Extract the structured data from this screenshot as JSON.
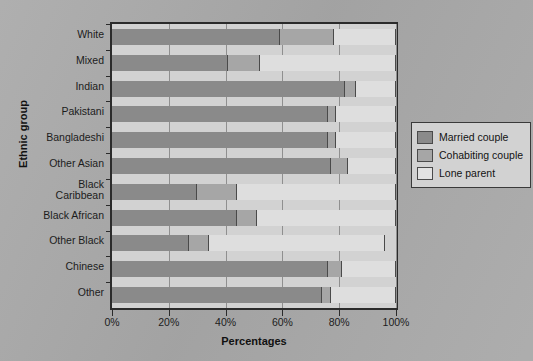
{
  "chart_data": {
    "type": "bar",
    "orientation": "horizontal",
    "stacked": true,
    "stack_mode": "percent",
    "title": "",
    "xlabel": "Percentages",
    "ylabel": "Ethnic group",
    "xlim": [
      0,
      100
    ],
    "xticks": [
      0,
      20,
      40,
      60,
      80,
      100
    ],
    "xtick_labels": [
      "0%",
      "20%",
      "40%",
      "60%",
      "80%",
      "100%"
    ],
    "grid": true,
    "legend_position": "right",
    "categories": [
      "White",
      "Mixed",
      "Indian",
      "Pakistani",
      "Bangladeshi",
      "Other Asian",
      "Black Caribbean",
      "Black African",
      "Other Black",
      "Chinese",
      "Other"
    ],
    "series": [
      {
        "name": "Married couple",
        "color": "#8a8a8a",
        "values": [
          59,
          41,
          82,
          76,
          76,
          77,
          30,
          44,
          27,
          76,
          74
        ]
      },
      {
        "name": "Cohabiting couple",
        "color": "#a6a6a6",
        "values": [
          19,
          11,
          4,
          3,
          3,
          6,
          14,
          7,
          7,
          5,
          3
        ]
      },
      {
        "name": "Lone parent",
        "color": "#dedede",
        "values": [
          22,
          48,
          14,
          21,
          21,
          17,
          56,
          49,
          62,
          19,
          23
        ]
      }
    ],
    "cumulative_boundaries": [
      [
        59,
        78
      ],
      [
        41,
        52
      ],
      [
        82,
        86
      ],
      [
        76,
        79
      ],
      [
        76,
        79
      ],
      [
        77,
        83
      ],
      [
        30,
        44
      ],
      [
        44,
        51
      ],
      [
        27,
        34
      ],
      [
        76,
        81
      ],
      [
        74,
        77
      ]
    ]
  },
  "axes": {
    "y_title": "Ethnic group",
    "x_title": "Percentages",
    "x_tick_labels": [
      "0%",
      "20%",
      "40%",
      "60%",
      "80%",
      "100%"
    ],
    "y_tick_labels": [
      "White",
      "Mixed",
      "Indian",
      "Pakistani",
      "Bangladeshi",
      "Other Asian",
      "Black Caribbean",
      "Black African",
      "Other Black",
      "Chinese",
      "Other"
    ]
  },
  "legend": {
    "items": [
      {
        "label": "Married couple",
        "color": "#8a8a8a"
      },
      {
        "label": "Cohabiting couple",
        "color": "#a6a6a6"
      },
      {
        "label": "Lone parent",
        "color": "#e2e2e2"
      }
    ]
  },
  "title": ""
}
